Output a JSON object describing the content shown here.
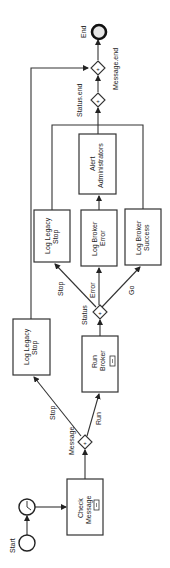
{
  "diagram": {
    "orientation": "rotated -90deg (flow runs bottom to top)",
    "events": {
      "start": {
        "label": "Start",
        "cx": 27,
        "cy": 543,
        "r": 8
      },
      "timer": {
        "cx": 27,
        "cy": 507,
        "r": 8
      },
      "end": {
        "label": "End",
        "cx": 99,
        "cy": 32,
        "r": 7,
        "fill": "#e6e6e6"
      }
    },
    "tasks": [
      {
        "id": "check-message",
        "lines": [
          "Check",
          "Message"
        ],
        "x": 67,
        "y": 479,
        "w": 36,
        "h": 56,
        "subprocess": true
      },
      {
        "id": "run-broker",
        "lines": [
          "Run",
          "Broker"
        ],
        "x": 82,
        "y": 336,
        "w": 36,
        "h": 56,
        "subprocess": true
      },
      {
        "id": "log-legacy-stop-1",
        "lines": [
          "Log Legacy",
          "Stop"
        ],
        "x": 13,
        "y": 319,
        "w": 37,
        "h": 56,
        "subprocess": false
      },
      {
        "id": "log-legacy-stop-2",
        "lines": [
          "Log Legacy",
          "Stop"
        ],
        "x": 34,
        "y": 210,
        "w": 36,
        "h": 52,
        "subprocess": false
      },
      {
        "id": "log-broker-error",
        "lines": [
          "Log Broker",
          "Error"
        ],
        "x": 81,
        "y": 210,
        "w": 36,
        "h": 56,
        "subprocess": false
      },
      {
        "id": "log-broker-success",
        "lines": [
          "Log Broker",
          "Success"
        ],
        "x": 125,
        "y": 209,
        "w": 36,
        "h": 56,
        "subprocess": false
      },
      {
        "id": "alert-administrators",
        "lines": [
          "Alert",
          "Administrators"
        ],
        "x": 79,
        "y": 134,
        "w": 37,
        "h": 60,
        "subprocess": false
      }
    ],
    "gateways": [
      {
        "id": "message-gateway",
        "label": "Message",
        "cx": 84,
        "cy": 442
      },
      {
        "id": "status-gateway",
        "label": "Status",
        "cx": 99,
        "cy": 312
      },
      {
        "id": "status-end-gateway",
        "label": "Status.end",
        "cx": 98,
        "cy": 100
      },
      {
        "id": "message-end-gateway",
        "label": "Message.end",
        "cx": 97,
        "cy": 68
      }
    ],
    "edge_labels": {
      "stop1": "Stop",
      "run": "Run",
      "stop2": "Stop",
      "error": "Error",
      "go": "Go"
    }
  }
}
